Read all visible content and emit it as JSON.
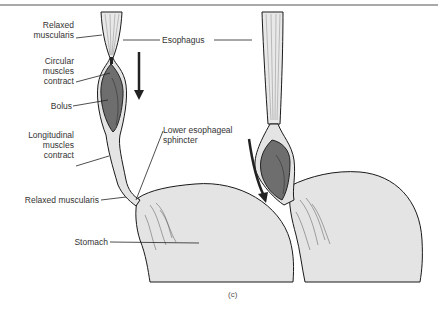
{
  "figure": {
    "caption": "(c)",
    "colors": {
      "tissue_fill": "#e4e4e4",
      "bolus_fill": "#6e6e6e",
      "outline": "#1a1a1a",
      "label_text": "#333333"
    }
  },
  "labels": {
    "relaxed_muscularis_top_1": "Relaxed",
    "relaxed_muscularis_top_2": "muscularis",
    "circular_1": "Circular",
    "circular_2": "muscles",
    "circular_3": "contract",
    "bolus": "Bolus",
    "longitudinal_1": "Longitudinal",
    "longitudinal_2": "muscles",
    "longitudinal_3": "contract",
    "relaxed_muscularis_bottom": "Relaxed muscularis",
    "esophagus": "Esophagus",
    "les_1": "Lower esophageal",
    "les_2": "sphincter",
    "stomach": "Stomach"
  },
  "arrows": [
    {
      "name": "downward-arrow-left",
      "direction": "down"
    },
    {
      "name": "curved-arrow-right",
      "direction": "down-right"
    }
  ]
}
